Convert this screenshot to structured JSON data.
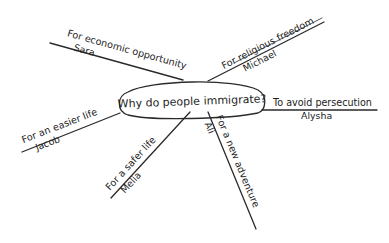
{
  "center": {
    "label": "Why do people immigrate?"
  },
  "branches": [
    {
      "id": "economic",
      "reason": "For economic opportunity",
      "person": "Sara"
    },
    {
      "id": "religious",
      "reason": "For religious freedom",
      "person": "Michael"
    },
    {
      "id": "persecution",
      "reason": "To avoid persecution",
      "person": "Alysha"
    },
    {
      "id": "easier",
      "reason": "For an easier life",
      "person": "Jacob"
    },
    {
      "id": "safer",
      "reason": "For a safer life",
      "person": "Melia"
    },
    {
      "id": "adventure",
      "reason": "For a new adventure",
      "person": "Ali"
    }
  ],
  "colors": {
    "ink": "#2a2a2a",
    "background": "#ffffff"
  }
}
